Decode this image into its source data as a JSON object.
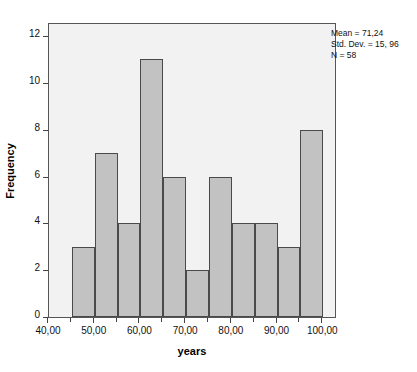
{
  "chart_data": {
    "type": "bar",
    "title": "",
    "subtitle": "",
    "xlabel": "years",
    "ylabel": "Frequency",
    "xlim": [
      40,
      103
    ],
    "ylim": [
      0,
      12.6
    ],
    "grid": false,
    "legend": null,
    "bin_width": 5,
    "categories": [
      "45-50",
      "50-55",
      "55-60",
      "60-65",
      "65-70",
      "70-75",
      "75-80",
      "80-85",
      "85-90",
      "90-95",
      "95-100"
    ],
    "bin_edges": [
      45,
      50,
      55,
      60,
      65,
      70,
      75,
      80,
      85,
      90,
      95,
      100
    ],
    "values": [
      3,
      7,
      4,
      11,
      6,
      2,
      6,
      4,
      4,
      3,
      8
    ],
    "x_ticks": [
      40,
      50,
      60,
      70,
      80,
      90,
      100
    ],
    "x_tick_labels": [
      "40,00",
      "50,00",
      "60,00",
      "70,00",
      "80,00",
      "90,00",
      "100,00"
    ],
    "x_minor_ticks": [
      45,
      55,
      65,
      75,
      85,
      95
    ],
    "y_ticks": [
      0,
      2,
      4,
      6,
      8,
      10,
      12
    ],
    "y_tick_labels": [
      "0",
      "2",
      "4",
      "6",
      "8",
      "10",
      "12"
    ],
    "annotations": [
      "Mean = 71,24",
      "Std. Dev. = 15, 96",
      "N = 58"
    ],
    "colors": {
      "bar_fill": "#c2c2c2",
      "bar_edge": "#4a4a4a",
      "plot_background": "#f2f2f2",
      "frame": "#555555",
      "text": "#111111",
      "figure_background": "#ffffff"
    }
  },
  "stats": {
    "mean_line": "Mean = 71,24",
    "stddev_line": "Std. Dev. = 15, 96",
    "n_line": "N = 58"
  },
  "axes": {
    "x_title": "years",
    "y_title": "Frequency"
  },
  "ghost_text": {
    "line1": "Grafico Gaussiano",
    "line2": "Prueba Gaussiana"
  }
}
